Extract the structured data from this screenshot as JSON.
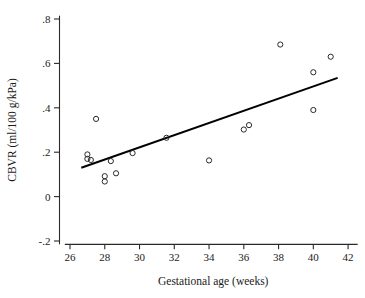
{
  "chart_data": {
    "type": "scatter",
    "title": "",
    "xlabel": "Gestational age (weeks)",
    "ylabel": "CBVR (ml/100 g/kPa)",
    "xlim": [
      25.5,
      42.6
    ],
    "ylim": [
      -0.24,
      0.83
    ],
    "grid": false,
    "legend": null,
    "xticks": [
      26,
      28,
      30,
      32,
      34,
      36,
      38,
      40,
      42
    ],
    "xtick_labels": [
      "26",
      "28",
      "30",
      "32",
      "34",
      "36",
      "38",
      "40",
      "42"
    ],
    "yticks": [
      -0.2,
      0,
      0.2,
      0.4,
      0.6,
      0.8
    ],
    "ytick_labels": [
      "-.2",
      "0",
      ".2",
      ".4",
      ".6",
      ".8"
    ],
    "marker": "open-circle",
    "marker_color": "#2a2a2a",
    "points": [
      {
        "x": 27.0,
        "y": 0.19
      },
      {
        "x": 27.0,
        "y": 0.17
      },
      {
        "x": 27.2,
        "y": 0.165
      },
      {
        "x": 27.5,
        "y": 0.35
      },
      {
        "x": 28.0,
        "y": 0.092
      },
      {
        "x": 28.0,
        "y": 0.068
      },
      {
        "x": 28.35,
        "y": 0.16
      },
      {
        "x": 28.65,
        "y": 0.105
      },
      {
        "x": 29.6,
        "y": 0.196
      },
      {
        "x": 31.55,
        "y": 0.265
      },
      {
        "x": 34.0,
        "y": 0.163
      },
      {
        "x": 36.0,
        "y": 0.302
      },
      {
        "x": 36.3,
        "y": 0.322
      },
      {
        "x": 38.1,
        "y": 0.685
      },
      {
        "x": 40.0,
        "y": 0.39
      },
      {
        "x": 40.0,
        "y": 0.56
      },
      {
        "x": 41.0,
        "y": 0.63
      }
    ],
    "fit_line": {
      "type": "linear-regression",
      "color": "#000000",
      "x_start": 26.65,
      "y_start": 0.13,
      "x_end": 41.4,
      "y_end": 0.535
    }
  }
}
